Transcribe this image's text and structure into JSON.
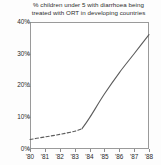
{
  "chart_data": {
    "type": "line",
    "title": "% children under 5 with diarrhoea being\ntreated with ORT in developing countries",
    "xlabel": "",
    "ylabel": "",
    "xlim": [
      1980,
      1988
    ],
    "ylim": [
      0,
      40
    ],
    "grid": false,
    "legend": "none",
    "y_ticks": [
      0,
      10,
      20,
      30,
      40
    ],
    "y_tick_labels": [
      "0%",
      "10%",
      "20%",
      "30%",
      "40%"
    ],
    "x_ticks": [
      1980,
      1981,
      1982,
      1983,
      1984,
      1985,
      1986,
      1987,
      1988
    ],
    "x_tick_labels": [
      "'80",
      "'81",
      "'82",
      "'83",
      "'84",
      "'85",
      "'86",
      "'87",
      "'88"
    ],
    "series": [
      {
        "name": "ORT treatment coverage (estimated)",
        "style": "dashed",
        "color": "#5c5c5c",
        "x": [
          1980,
          1981,
          1982,
          1983,
          1983.5
        ],
        "values": [
          3.0,
          3.8,
          4.6,
          5.6,
          6.4
        ]
      },
      {
        "name": "ORT treatment coverage (reported)",
        "style": "solid",
        "color": "#5c5c5c",
        "x": [
          1983.5,
          1984,
          1985,
          1986,
          1987,
          1988
        ],
        "values": [
          6.4,
          9.8,
          17.3,
          24.0,
          30.0,
          36.0
        ]
      }
    ]
  }
}
